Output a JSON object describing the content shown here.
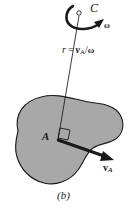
{
  "figure": {
    "caption": "(b)",
    "background_color": "#ffffff",
    "body_fill_color": "#a8a8a8",
    "body_stroke_color": "#1a1a1a",
    "ink_color": "#1a1a1a"
  },
  "labels": {
    "center_point": "C",
    "angular_velocity": "ω",
    "radius_equation": {
      "lhs": "r",
      "equals": "=",
      "numerator": "v",
      "numerator_subscript": "A",
      "divider": "/",
      "denominator": "ω",
      "full_text": "r = v_A/ω"
    },
    "body_point": "A",
    "velocity_vector": "v",
    "velocity_vector_subscript": "A",
    "velocity_vector_full": "v_A"
  },
  "geometry": {
    "instant_center_marker": {
      "x": 79,
      "y": 13,
      "radius": 2.2,
      "name": "instantaneous-center-C"
    },
    "point_A": {
      "x": 58,
      "y": 140
    },
    "radius_line": {
      "from_x": 79,
      "from_y": 15,
      "to_x": 58,
      "to_y": 140
    },
    "velocity_arrow": {
      "from_x": 58,
      "from_y": 140,
      "to_x": 112,
      "to_y": 159
    },
    "right_angle_marker": {
      "present": true,
      "size": 11
    },
    "rotation_arc": {
      "direction": "clockwise"
    }
  }
}
